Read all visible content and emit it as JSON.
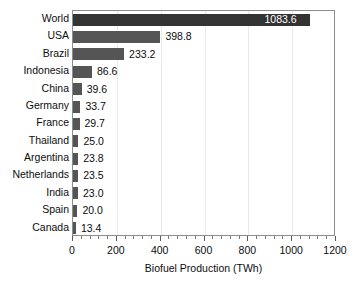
{
  "chart_data": {
    "type": "bar",
    "orientation": "horizontal",
    "title": "",
    "xlabel": "Biofuel Production (TWh)",
    "ylabel": "",
    "xlim": [
      0,
      1200
    ],
    "xticks": [
      0,
      200,
      400,
      600,
      800,
      1000,
      1200
    ],
    "xtick_labels": [
      "0",
      "200",
      "400",
      "600",
      "800",
      "1000",
      "1200"
    ],
    "minor_tick_interval": 40,
    "grid": "vertical-major-only",
    "legend": "none",
    "categories": [
      "World",
      "USA",
      "Brazil",
      "Indonesia",
      "China",
      "Germany",
      "France",
      "Thailand",
      "Argentina",
      "Netherlands",
      "India",
      "Spain",
      "Canada"
    ],
    "values": [
      1083.6,
      398.8,
      233.2,
      86.6,
      39.6,
      33.7,
      29.7,
      25.0,
      23.8,
      23.5,
      23.0,
      20.0,
      13.4
    ],
    "value_labels": [
      "1083.6",
      "398.8",
      "233.2",
      "86.6",
      "39.6",
      "33.7",
      "29.7",
      "25.0",
      "23.8",
      "23.5",
      "23.0",
      "20.0",
      "13.4"
    ],
    "label_inside_bar": [
      true,
      false,
      false,
      false,
      false,
      false,
      false,
      false,
      false,
      false,
      false,
      false,
      false
    ],
    "bar_color": "#555555",
    "highlight_bar_color": "#333333",
    "highlight_category": "World",
    "inside_label_color": "#ffffff",
    "outside_label_color": "#0d0d0d",
    "background_color": "#ffffff",
    "frame_color": "#8d8d8d",
    "gridline_color": "#e9e9e9"
  }
}
